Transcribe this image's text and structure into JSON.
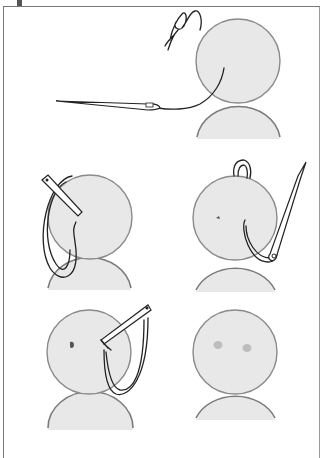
{
  "diagram": {
    "type": "instructional-illustration",
    "colors": {
      "head_fill": "#e6e6e6",
      "outline": "#8a8a8a",
      "thread": "#222222",
      "frame": "#777777"
    },
    "panels": [
      {
        "id": 1,
        "step": "thread knotted, needle inserted through back of head toward face",
        "icon": "needle-icon"
      },
      {
        "id": 2,
        "step": "needle emerges at eye position, thread looped",
        "icon": "needle-icon"
      },
      {
        "id": 3,
        "step": "needle pulled back out side of head, small stitch visible at eye",
        "icon": "needle-icon"
      },
      {
        "id": 4,
        "step": "second eye stitched, thread looped",
        "icon": "needle-icon"
      },
      {
        "id": 5,
        "step": "finished face with two eyes",
        "icon": "doll-face-icon"
      }
    ]
  }
}
